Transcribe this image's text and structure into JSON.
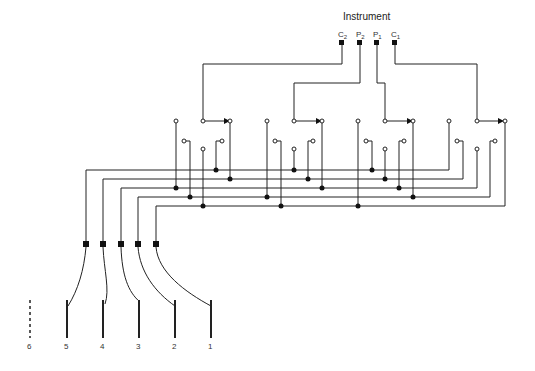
{
  "title": "Instrument",
  "terminals": [
    {
      "id": "C2",
      "base": "C",
      "sub": "2",
      "x": 342
    },
    {
      "id": "P2",
      "base": "P",
      "sub": "2",
      "x": 360
    },
    {
      "id": "P1",
      "base": "P",
      "sub": "1",
      "x": 377
    },
    {
      "id": "C1",
      "base": "C",
      "sub": "1",
      "x": 395
    }
  ],
  "electrodes": [
    {
      "label": "6",
      "style": "dashed"
    },
    {
      "label": "5",
      "style": "solid"
    },
    {
      "label": "4",
      "style": "solid"
    },
    {
      "label": "3",
      "style": "solid"
    },
    {
      "label": "2",
      "style": "solid"
    },
    {
      "label": "1",
      "style": "solid"
    }
  ],
  "switch_groups": 4,
  "bus_lines": 5
}
